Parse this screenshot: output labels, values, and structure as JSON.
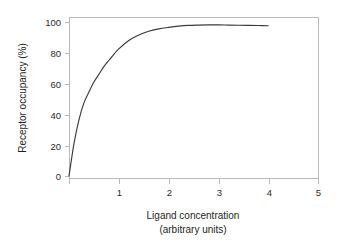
{
  "chart_data": {
    "type": "line",
    "title": "",
    "subtitle": "",
    "xlabel": "Ligand concentration",
    "xlabel_line2": "(arbitrary units)",
    "ylabel": "Receptor occupancy (%)",
    "xlim": [
      0,
      5
    ],
    "ylim": [
      0,
      100
    ],
    "xticks": [
      0,
      1,
      2,
      3,
      4,
      5
    ],
    "xtick_labels": [
      "",
      "1",
      "2",
      "3",
      "4",
      "5"
    ],
    "yticks": [
      0,
      20,
      40,
      60,
      80,
      100
    ],
    "ytick_labels": [
      "0",
      "20",
      "40",
      "60",
      "80",
      "100"
    ],
    "grid": false,
    "legend": null,
    "curve_color": "#3a3a3a",
    "frame_color": "#b9b9b9",
    "background_color": "#ffffff",
    "series": [
      {
        "name": "Receptor occupancy",
        "x": [
          0.0,
          0.1,
          0.2,
          0.3,
          0.4,
          0.5,
          0.6,
          0.7,
          0.8,
          0.9,
          1.0,
          1.2,
          1.4,
          1.6,
          1.8,
          2.0,
          2.2,
          2.4,
          2.6,
          2.8,
          3.0,
          3.2,
          3.4,
          3.6,
          3.8,
          4.0
        ],
        "y": [
          0.0,
          21.0,
          36.5,
          47.5,
          54.5,
          61.0,
          66.0,
          71.0,
          75.0,
          79.0,
          82.5,
          88.0,
          91.5,
          94.0,
          95.5,
          96.5,
          97.3,
          97.8,
          98.0,
          98.1,
          98.1,
          98.0,
          97.9,
          97.8,
          97.7,
          97.6
        ]
      }
    ]
  },
  "axis_geometry": {
    "x0_px": 69,
    "x5_px": 318,
    "y0_px": 176,
    "y100_px": 22,
    "frame_top_px": 17,
    "frame_bottom_px": 178
  }
}
